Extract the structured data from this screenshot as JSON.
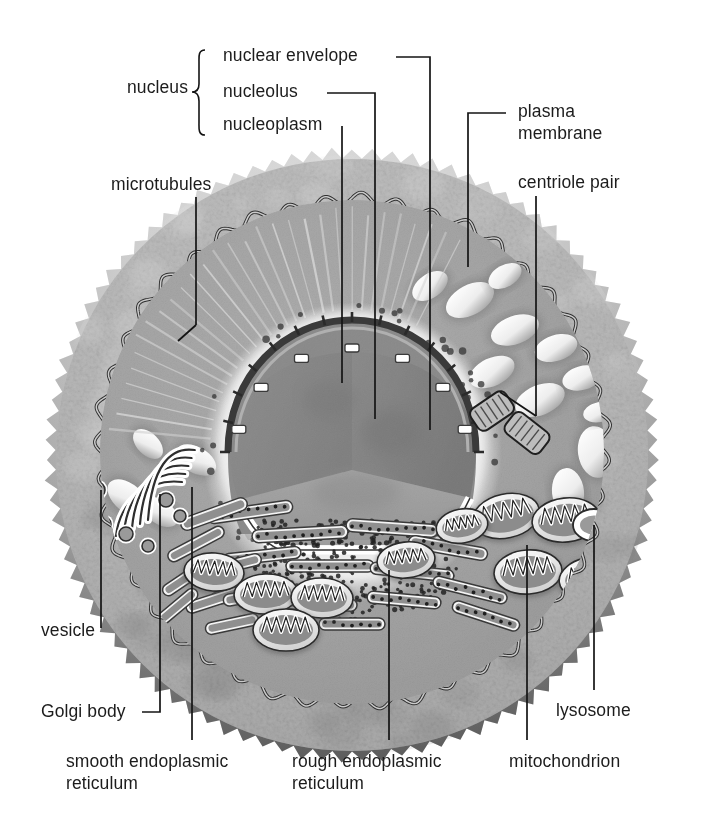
{
  "diagram": {
    "type": "labeled-biological-illustration",
    "style": "grayscale halftone airbrush illustration",
    "background_color": "#ffffff",
    "ink_color": "#1c1c1c"
  },
  "group_labels": [
    {
      "name": "nucleus-group",
      "text": "nucleus",
      "bracket": "curly",
      "members": [
        "nuclear envelope",
        "nucleolus",
        "nucleoplasm"
      ]
    }
  ],
  "labels": [
    {
      "id": "nucleus",
      "text": "nucleus",
      "align": "right"
    },
    {
      "id": "nuclear-envelope",
      "text": "nuclear envelope",
      "align": "left"
    },
    {
      "id": "nucleolus",
      "text": "nucleolus",
      "align": "left"
    },
    {
      "id": "nucleoplasm",
      "text": "nucleoplasm",
      "align": "left"
    },
    {
      "id": "plasma-membrane",
      "text": "plasma\nmembrane",
      "align": "left"
    },
    {
      "id": "centriole-pair",
      "text": "centriole pair",
      "align": "left"
    },
    {
      "id": "microtubules",
      "text": "microtubules",
      "align": "left"
    },
    {
      "id": "vesicle",
      "text": "vesicle",
      "align": "left"
    },
    {
      "id": "golgi-body",
      "text": "Golgi body",
      "align": "left"
    },
    {
      "id": "smooth-er",
      "text": "smooth endoplasmic\nreticulum",
      "align": "left"
    },
    {
      "id": "rough-er",
      "text": "rough endoplasmic\nreticulum",
      "align": "left"
    },
    {
      "id": "mitochondrion",
      "text": "mitochondrion",
      "align": "left"
    },
    {
      "id": "lysosome",
      "text": "lysosome",
      "align": "left"
    }
  ],
  "structures": [
    {
      "id": "cell-exterior",
      "label": "outer spiky cell coat",
      "shade_top": "#c9c9c9",
      "shade_bottom": "#8c8c8c"
    },
    {
      "id": "plasma-membrane",
      "label": "wavy plasma membrane boundary",
      "color": "#3a3a3a"
    },
    {
      "id": "cytoplasm",
      "label": "cytoplasm interior",
      "shade": "#a6a6a6"
    },
    {
      "id": "nucleus",
      "label": "nucleus with wedge cut away",
      "shade": "#888888"
    },
    {
      "id": "nuclear-envelope",
      "label": "segmented double membrane with pores",
      "color": "#4a4a4a"
    },
    {
      "id": "nucleolus",
      "label": "dark patch inside nucleus",
      "color": "#7a7a7a"
    },
    {
      "id": "microtubules",
      "label": "radiating fibers from nucleus to membrane",
      "count": 26
    },
    {
      "id": "centriole-pair",
      "label": "two striated cylinders at right angles",
      "count": 2
    },
    {
      "id": "mitochondria",
      "label": "oval organelles with internal cristae",
      "count": 9
    },
    {
      "id": "lysosome",
      "label": "small plain ring organelle",
      "count": 1
    },
    {
      "id": "golgi-body",
      "label": "stack of curved flattened cisternae",
      "cisternae": 5
    },
    {
      "id": "vesicles",
      "label": "small round vesicles near Golgi",
      "count": 5
    },
    {
      "id": "rough-er",
      "label": "flattened sacs studded with ribosome dots"
    },
    {
      "id": "smooth-er",
      "label": "tubular sacs without ribosomes"
    },
    {
      "id": "cytoplasmic-vesicles",
      "label": "bright lens-shaped vacuoles in cytoplasm",
      "count": 12
    }
  ]
}
